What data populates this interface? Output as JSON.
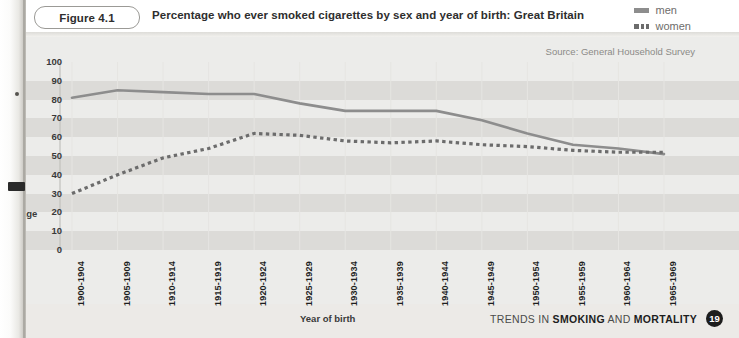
{
  "header": {
    "figure_badge": "Figure 4.1",
    "title": "Percentage who ever smoked cigarettes by sex and year of birth: Great Britain"
  },
  "legend": {
    "items": [
      {
        "label": "men",
        "style": "solid",
        "color": "#8d8d8d"
      },
      {
        "label": "women",
        "style": "dashed",
        "color": "#6c6c6c"
      }
    ]
  },
  "source_note": "Source: General Household Survey",
  "footer": {
    "text_parts": [
      "TRENDS IN ",
      "SMOKING",
      " AND ",
      "MORTALITY"
    ],
    "page_number": "19"
  },
  "axes": {
    "y_title": "Percentage",
    "x_title": "Year of birth",
    "y_ticks": [
      "100",
      "90",
      "80",
      "70",
      "60",
      "50",
      "40",
      "30",
      "20",
      "10",
      "0"
    ]
  },
  "chart_data": {
    "type": "line",
    "title": "Percentage who ever smoked cigarettes by sex and year of birth: Great Britain",
    "xlabel": "Year of birth",
    "ylabel": "Percentage",
    "ylim": [
      0,
      100
    ],
    "ytick_step": 10,
    "grid": "horizontal-bands",
    "legend_position": "top-right",
    "annotations": [
      "Source: General Household Survey"
    ],
    "categories": [
      "1900-1904",
      "1905-1909",
      "1910-1914",
      "1915-1919",
      "1920-1924",
      "1925-1929",
      "1930-1934",
      "1935-1939",
      "1940-1944",
      "1945-1949",
      "1950-1954",
      "1955-1959",
      "1960-1964",
      "1965-1969"
    ],
    "series": [
      {
        "name": "men",
        "style": "solid",
        "color": "#8d8d8d",
        "values": [
          81,
          85,
          84,
          83,
          83,
          78,
          74,
          74,
          74,
          69,
          62,
          56,
          54,
          51
        ]
      },
      {
        "name": "women",
        "style": "dotted",
        "color": "#6c6c6c",
        "values": [
          30,
          40,
          49,
          54,
          62,
          61,
          58,
          57,
          58,
          56,
          55,
          53,
          52,
          52
        ]
      }
    ]
  }
}
